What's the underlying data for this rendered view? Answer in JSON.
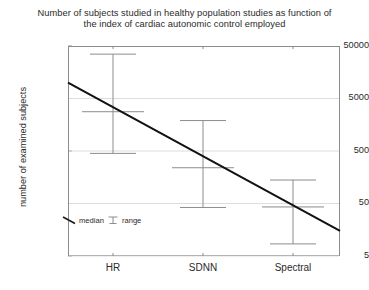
{
  "chart": {
    "title_line1": "Number of subjects studied in healthy population studies as function of",
    "title_line2": "the index of cardiac autonomic control employed",
    "ylabel": "number of examined subjects",
    "xlabel": "",
    "legend": {
      "median_label": "median",
      "range_label": "range",
      "median_icon": "diagonal-line-icon",
      "range_icon": "error-bar-icon"
    }
  },
  "chart_data": {
    "type": "scatter",
    "title": "Number of subjects studied in healthy population studies as function of the index of cardiac autonomic control employed",
    "xlabel": "",
    "ylabel": "number of examined subjects",
    "yscale": "log",
    "ylim": [
      5,
      50000
    ],
    "yticks": [
      50000,
      5000,
      500,
      50,
      5
    ],
    "ytick_labels": [
      "50000",
      "5000",
      "500",
      "50",
      "5"
    ],
    "categories": [
      "HR",
      "SDNN",
      "Spectral"
    ],
    "grid": true,
    "legend_position": "bottom-left",
    "series": [
      {
        "name": "median",
        "values": [
          2800,
          240,
          43
        ]
      },
      {
        "name": "range_upper",
        "values": [
          35000,
          1900,
          140
        ]
      },
      {
        "name": "range_lower",
        "values": [
          450,
          42,
          8.5
        ]
      }
    ],
    "trend_line": {
      "name": "trend",
      "x_start_fraction": 0.0,
      "x_end_fraction": 1.0,
      "y_start": 10000,
      "y_end": 15
    }
  },
  "geometry": {
    "plot_left": 68,
    "plot_top": 46,
    "plot_width": 272,
    "plot_height": 210,
    "y_top_value": 50000,
    "y_bottom_value": 5,
    "category_x": [
      113,
      203,
      293
    ],
    "ytick_y": [
      46,
      98.5,
      151,
      203.5,
      256
    ],
    "xlabel_y": 262
  }
}
